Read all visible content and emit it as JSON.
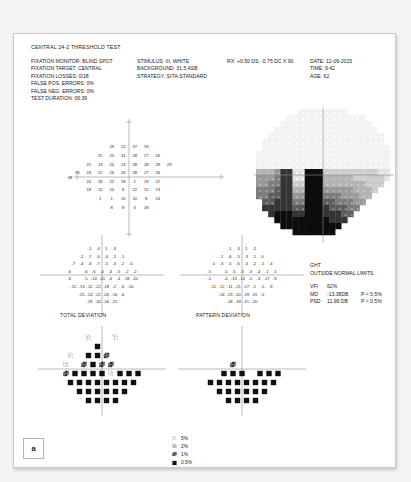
{
  "panel_label": "a",
  "header": {
    "title": "CENTRAL 24-2 THRESHOLD TEST",
    "left_column": [
      "FIXATION MONITOR: BLIND SPOT",
      "FIXATION TARGET: CENTRAL",
      "FIXATION LOSSES: 0/18",
      "FALSE POS. ERRORS: 0%",
      "FALSE NEG. ERRORS: 0%",
      "TEST DURATION: 06:39"
    ],
    "middle_column": [
      "STIMULUS: III, WHITE",
      "BACKGROUND: 31.5 ASB",
      "STRATEGY: SITA-STANDARD"
    ],
    "rx": "RX: +0.50 DS, -0.75 DC X 90",
    "right_column": [
      "DATE: 12-09-2015",
      "TIME: 9:42",
      "AGE: 62"
    ]
  },
  "indices": {
    "ght_label": "GHT",
    "ght_value": "OUTSIDE NORMAL LIMITS",
    "vfi_key": "VFI",
    "vfi_value": "62%",
    "md_key": "MD",
    "md_value": "-13.38DB",
    "md_p": "P < 0.5%",
    "psd_key": "PSD",
    "psd_value": "11.99 DB",
    "psd_p": "P < 0.5%"
  },
  "captions": {
    "total_deviation": "TOTAL DEVIATION",
    "pattern_deviation": "PATTERN DEVIATION"
  },
  "blind_spot_marker": "38",
  "legend": {
    "title": "",
    "items": [
      {
        "label": "5%",
        "level": 1
      },
      {
        "label": "2%",
        "level": 2
      },
      {
        "label": "1%",
        "level": 3
      },
      {
        "label": "0.5%",
        "level": 4
      }
    ]
  },
  "chart_data": {
    "type": "table",
    "title": "CENTRAL 24-2 THRESHOLD TEST",
    "grid_spacing_deg": 6,
    "eye": "right",
    "threshold_values": {
      "description": "Threshold sensitivity in dB by row (top to bottom), left to right; null = not tested",
      "rows": [
        {
          "y": 21,
          "xs": [
            -9,
            -3,
            3,
            9
          ],
          "values": [
            29,
            22,
            27,
            19
          ]
        },
        {
          "y": 15,
          "xs": [
            -15,
            -9,
            -3,
            3,
            9,
            15
          ],
          "values": [
            25,
            25,
            31,
            28,
            27,
            26
          ]
        },
        {
          "y": 9,
          "xs": [
            -21,
            -15,
            -9,
            -3,
            3,
            9,
            15,
            21
          ],
          "values": [
            21,
            23,
            24,
            24,
            28,
            28,
            29,
            29
          ]
        },
        {
          "y": 3,
          "xs": [
            -27,
            -21,
            -15,
            -9,
            -3,
            3,
            9,
            15,
            21,
            27
          ],
          "values": [
            38,
            24,
            22,
            26,
            26,
            28,
            27,
            26,
            null,
            null
          ]
        },
        {
          "y": -3,
          "xs": [
            -27,
            -21,
            -15,
            -9,
            -3,
            3,
            9,
            15,
            21,
            27
          ],
          "values": [
            null,
            24,
            18,
            22,
            18,
            1,
            19,
            22,
            null,
            null
          ]
        },
        {
          "y": -9,
          "xs": [
            -21,
            -15,
            -9,
            -3,
            3,
            9,
            15,
            21
          ],
          "values": [
            18,
            15,
            10,
            8,
            22,
            15,
            13,
            null
          ]
        },
        {
          "y": -15,
          "xs": [
            -15,
            -9,
            -3,
            3,
            9,
            15
          ],
          "values": [
            1,
            1,
            10,
            10,
            8,
            14
          ]
        },
        {
          "y": -21,
          "xs": [
            -9,
            -3,
            3,
            9
          ],
          "values": [
            8,
            8,
            3,
            18
          ]
        }
      ]
    },
    "total_deviation_values": {
      "description": "Total deviation in dB by row (top to bottom)",
      "rows": [
        {
          "y": 21,
          "values": [
            -1,
            -4,
            1,
            -3
          ]
        },
        {
          "y": 15,
          "values": [
            -2,
            -7,
            -6,
            -4,
            -2,
            -1
          ]
        },
        {
          "y": 9,
          "values": [
            -7,
            -4,
            -6,
            -7,
            -5,
            -3,
            -2,
            -5
          ]
        },
        {
          "y": 3,
          "values": [
            -6,
            null,
            -6,
            -6,
            -4,
            -4,
            -5,
            -2,
            -2
          ]
        },
        {
          "y": -3,
          "values": [
            -6,
            null,
            -5,
            -14,
            -15,
            -6,
            -4,
            -18,
            -10
          ]
        },
        {
          "y": -9,
          "values": [
            -12,
            -13,
            -12,
            -22,
            -18,
            -2,
            -6,
            -10
          ]
        },
        {
          "y": -15,
          "values": [
            -25,
            -24,
            -21,
            -20,
            -16,
            -6
          ]
        },
        {
          "y": -21,
          "values": [
            -19,
            -20,
            -16,
            -21
          ]
        }
      ]
    },
    "pattern_deviation_values": {
      "description": "Pattern deviation in dB by row (top to bottom)",
      "rows": [
        {
          "y": 21,
          "values": [
            -1,
            -3,
            1,
            -2
          ]
        },
        {
          "y": 15,
          "values": [
            -1,
            -6,
            -5,
            -3,
            -1,
            0
          ]
        },
        {
          "y": 9,
          "values": [
            -5,
            -3,
            -5,
            -6,
            -4,
            -2,
            -1,
            -4
          ]
        },
        {
          "y": 3,
          "values": [
            -5,
            null,
            -5,
            -5,
            -3,
            -3,
            -4,
            -1,
            -1
          ]
        },
        {
          "y": -3,
          "values": [
            -5,
            null,
            -4,
            -13,
            -14,
            -5,
            -3,
            -17,
            -9
          ]
        },
        {
          "y": -9,
          "values": [
            -11,
            -12,
            -11,
            -21,
            -17,
            -1,
            -5,
            -9
          ]
        },
        {
          "y": -15,
          "values": [
            -24,
            -23,
            -20,
            -19,
            -15,
            -5
          ]
        },
        {
          "y": -21,
          "values": [
            -18,
            -19,
            -15,
            -20
          ]
        }
      ]
    },
    "total_deviation_probability": {
      "description": "Probability symbol level per point: 0=normal/blank, 1=p<5%, 2=p<2%, 3=p<1%, 4=p<0.5%",
      "rows": [
        {
          "y": 21,
          "levels": [
            1,
            0,
            0,
            1
          ]
        },
        {
          "y": 15,
          "levels": [
            0,
            0,
            4,
            0,
            0,
            0
          ]
        },
        {
          "y": 9,
          "levels": [
            1,
            0,
            4,
            4,
            3,
            0,
            0,
            0
          ]
        },
        {
          "y": 3,
          "levels": [
            1,
            0,
            3,
            4,
            3,
            3,
            0,
            0,
            0
          ]
        },
        {
          "y": -3,
          "levels": [
            3,
            4,
            4,
            4,
            4,
            1,
            4,
            4,
            4
          ]
        },
        {
          "y": -9,
          "levels": [
            4,
            4,
            4,
            4,
            4,
            4,
            4,
            4
          ]
        },
        {
          "y": -15,
          "levels": [
            4,
            4,
            4,
            4,
            4,
            4
          ]
        },
        {
          "y": -21,
          "levels": [
            4,
            4,
            4,
            4
          ]
        }
      ]
    },
    "pattern_deviation_probability": {
      "description": "Probability symbol level per point: 0=normal/blank, 1=p<5%, 2=p<2%, 3=p<1%, 4=p<0.5%",
      "rows": [
        {
          "y": 21,
          "levels": [
            0,
            0,
            0,
            0
          ]
        },
        {
          "y": 15,
          "levels": [
            0,
            0,
            0,
            0,
            0,
            0
          ]
        },
        {
          "y": 9,
          "levels": [
            0,
            0,
            0,
            0,
            0,
            0,
            0,
            0
          ]
        },
        {
          "y": 3,
          "levels": [
            0,
            0,
            0,
            3,
            0,
            0,
            0,
            0,
            0
          ]
        },
        {
          "y": -3,
          "levels": [
            0,
            0,
            4,
            4,
            4,
            0,
            4,
            4,
            4
          ]
        },
        {
          "y": -9,
          "levels": [
            4,
            4,
            4,
            4,
            4,
            4,
            4,
            4
          ]
        },
        {
          "y": -15,
          "levels": [
            4,
            4,
            4,
            4,
            4,
            4
          ]
        },
        {
          "y": -21,
          "levels": [
            4,
            4,
            4,
            4
          ]
        }
      ]
    },
    "grayscale_map": {
      "description": "Greyscale sensitivity map, 0 = lightest (normal) to 9 = darkest (deepest defect), rows top to bottom over a 22x22 cell field",
      "rows": [
        [
          0,
          0,
          0,
          0,
          0,
          0,
          0,
          1,
          1,
          1,
          1,
          1,
          1,
          1,
          1,
          0,
          0,
          0,
          0,
          0,
          0,
          0
        ],
        [
          0,
          0,
          0,
          0,
          0,
          1,
          1,
          1,
          1,
          1,
          1,
          1,
          1,
          1,
          1,
          1,
          1,
          1,
          0,
          0,
          0,
          0
        ],
        [
          0,
          0,
          0,
          0,
          1,
          1,
          1,
          1,
          1,
          1,
          1,
          1,
          1,
          1,
          1,
          1,
          1,
          1,
          1,
          0,
          0,
          0
        ],
        [
          0,
          0,
          0,
          1,
          1,
          1,
          1,
          1,
          1,
          1,
          1,
          1,
          1,
          1,
          1,
          1,
          1,
          1,
          1,
          1,
          0,
          0
        ],
        [
          0,
          0,
          1,
          1,
          1,
          1,
          1,
          1,
          1,
          1,
          1,
          1,
          1,
          1,
          1,
          1,
          1,
          1,
          1,
          1,
          1,
          0
        ],
        [
          0,
          1,
          1,
          1,
          1,
          1,
          1,
          1,
          1,
          1,
          1,
          1,
          1,
          1,
          1,
          1,
          1,
          1,
          1,
          1,
          1,
          0
        ],
        [
          0,
          1,
          1,
          1,
          1,
          1,
          1,
          1,
          1,
          1,
          1,
          1,
          1,
          1,
          1,
          1,
          1,
          1,
          1,
          1,
          1,
          1
        ],
        [
          1,
          1,
          1,
          1,
          1,
          1,
          1,
          1,
          1,
          1,
          1,
          1,
          1,
          1,
          1,
          1,
          1,
          1,
          1,
          1,
          1,
          1
        ],
        [
          1,
          1,
          1,
          1,
          1,
          1,
          1,
          1,
          1,
          1,
          1,
          1,
          1,
          1,
          1,
          1,
          1,
          1,
          1,
          1,
          1,
          1
        ],
        [
          1,
          1,
          1,
          1,
          1,
          1,
          1,
          1,
          1,
          1,
          1,
          1,
          1,
          1,
          1,
          1,
          1,
          1,
          1,
          1,
          1,
          1
        ],
        [
          4,
          4,
          4,
          5,
          8,
          8,
          2,
          2,
          9,
          9,
          9,
          3,
          3,
          3,
          3,
          3,
          3,
          3,
          3,
          3,
          2,
          2
        ],
        [
          5,
          5,
          5,
          6,
          8,
          8,
          2,
          2,
          9,
          9,
          9,
          4,
          4,
          4,
          4,
          4,
          3,
          3,
          3,
          3,
          3,
          2
        ],
        [
          5,
          5,
          6,
          6,
          8,
          8,
          3,
          3,
          9,
          9,
          9,
          4,
          4,
          4,
          4,
          4,
          4,
          4,
          3,
          3,
          3,
          0
        ],
        [
          6,
          6,
          6,
          7,
          8,
          8,
          4,
          4,
          9,
          9,
          9,
          5,
          5,
          5,
          5,
          5,
          4,
          4,
          4,
          3,
          0,
          0
        ],
        [
          6,
          6,
          7,
          7,
          8,
          8,
          5,
          5,
          9,
          9,
          9,
          6,
          6,
          6,
          5,
          5,
          5,
          4,
          4,
          0,
          0,
          0
        ],
        [
          0,
          7,
          7,
          8,
          8,
          8,
          6,
          6,
          9,
          9,
          9,
          7,
          7,
          6,
          6,
          6,
          5,
          5,
          0,
          0,
          0,
          0
        ],
        [
          0,
          8,
          8,
          8,
          8,
          8,
          7,
          7,
          9,
          9,
          9,
          8,
          7,
          7,
          7,
          6,
          6,
          0,
          0,
          0,
          0,
          0
        ],
        [
          0,
          0,
          8,
          9,
          9,
          9,
          8,
          8,
          9,
          9,
          9,
          8,
          8,
          8,
          7,
          7,
          0,
          0,
          0,
          0,
          0,
          0
        ],
        [
          0,
          0,
          0,
          9,
          9,
          9,
          9,
          9,
          9,
          9,
          9,
          9,
          8,
          8,
          8,
          0,
          0,
          0,
          0,
          0,
          0,
          0
        ],
        [
          0,
          0,
          0,
          0,
          9,
          9,
          9,
          9,
          9,
          9,
          9,
          9,
          9,
          9,
          0,
          0,
          0,
          0,
          0,
          0,
          0,
          0
        ],
        [
          0,
          0,
          0,
          0,
          0,
          0,
          9,
          9,
          9,
          9,
          9,
          9,
          9,
          0,
          0,
          0,
          0,
          0,
          0,
          0,
          0,
          0
        ],
        [
          0,
          0,
          0,
          0,
          0,
          0,
          0,
          0,
          0,
          0,
          0,
          0,
          0,
          0,
          0,
          0,
          0,
          0,
          0,
          0,
          0,
          0
        ]
      ]
    }
  }
}
